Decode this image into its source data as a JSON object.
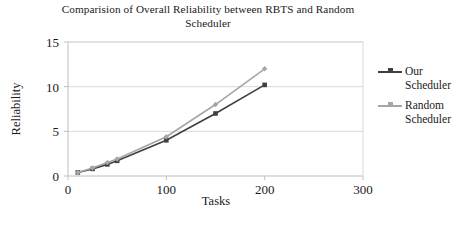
{
  "chart_data": {
    "type": "line",
    "title": "Comparision of Overall Reliability between RBTS and Random Scheduler",
    "xlabel": "Tasks",
    "ylabel": "Reliability",
    "xlim": [
      0,
      300
    ],
    "ylim": [
      0,
      15
    ],
    "xticks": [
      0,
      100,
      200,
      300
    ],
    "yticks": [
      0,
      5,
      10,
      15
    ],
    "xtick_labels": [
      "0",
      "100",
      "200",
      "300"
    ],
    "ytick_labels": [
      "0",
      "5",
      "10",
      "15"
    ],
    "grid": "horizontal",
    "legend_position": "right",
    "series": [
      {
        "name": "Our Scheduler",
        "color": "#404040",
        "marker": "square",
        "x": [
          10,
          25,
          40,
          50,
          100,
          150,
          200
        ],
        "y": [
          0.4,
          0.8,
          1.3,
          1.7,
          4.0,
          7.0,
          10.2
        ]
      },
      {
        "name": "Random Scheduler",
        "color": "#a6a6a6",
        "marker": "diamond",
        "x": [
          10,
          25,
          40,
          50,
          100,
          150,
          200
        ],
        "y": [
          0.4,
          0.9,
          1.5,
          1.9,
          4.4,
          8.0,
          12.0
        ]
      }
    ]
  },
  "legend": {
    "entries": [
      {
        "label": "Our\nScheduler",
        "color": "#404040"
      },
      {
        "label": "Random\nScheduler",
        "color": "#a6a6a6"
      }
    ]
  },
  "axes": {
    "x_title": "Tasks",
    "y_title": "Reliability"
  },
  "colors": {
    "our_scheduler": "#404040",
    "random_scheduler": "#a6a6a6",
    "grid": "#d9d9d9",
    "axis": "#bfbfbf",
    "text": "#1a1a1a"
  }
}
